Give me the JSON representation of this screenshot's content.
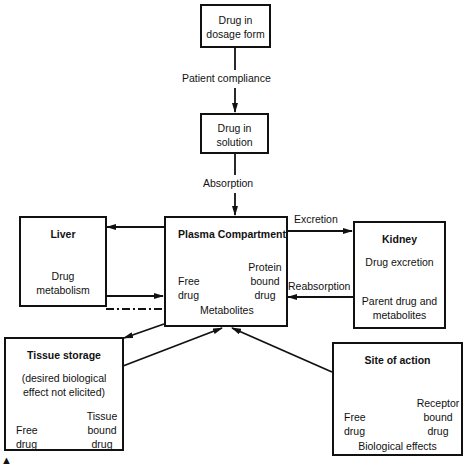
{
  "diagram": {
    "nodes": {
      "dosage_form": {
        "lines": [
          "Drug in",
          "dosage form"
        ]
      },
      "solution": {
        "lines": [
          "Drug in",
          "solution"
        ]
      },
      "liver": {
        "title": "Liver",
        "body": [
          "Drug",
          "metabolism"
        ]
      },
      "plasma": {
        "title": "Plasma Compartment",
        "left": [
          "Free",
          "drug"
        ],
        "right": [
          "Protein",
          "bound",
          "drug"
        ],
        "metabolites": "Metabolites"
      },
      "kidney": {
        "title": "Kidney",
        "body1": "Drug excretion",
        "body2": [
          "Parent drug and",
          "metabolites"
        ]
      },
      "tissue": {
        "title": "Tissue storage",
        "note": [
          "(desired biological",
          "effect not elicited)"
        ],
        "left": [
          "Free",
          "drug"
        ],
        "right": [
          "Tissue",
          "bound",
          "drug"
        ]
      },
      "site": {
        "title": "Site of action",
        "left": [
          "Free",
          "drug"
        ],
        "right": [
          "Receptor",
          "bound",
          "drug"
        ],
        "footer": "Biological effects"
      }
    },
    "edges": {
      "patient_compliance": "Patient compliance",
      "absorption": "Absorption",
      "excretion": "Excretion",
      "reabsorption": "Reabsorption"
    },
    "marker": "▲",
    "colors": {
      "line": "#111111",
      "background": "#ffffff"
    }
  }
}
